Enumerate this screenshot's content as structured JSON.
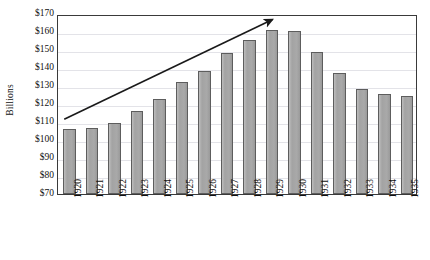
{
  "chart_data": {
    "type": "bar",
    "title": "",
    "subtitle": "",
    "xlabel": "",
    "ylabel": "Billions",
    "categories": [
      "1920",
      "1921",
      "1922",
      "1923",
      "1924",
      "1925",
      "1926",
      "1927",
      "1928",
      "1929",
      "1930",
      "1931",
      "1932",
      "1933",
      "1934",
      "1935"
    ],
    "values": [
      106,
      106.5,
      109.5,
      116,
      123,
      132.5,
      138.5,
      148.5,
      155.5,
      161,
      160.5,
      149,
      137,
      128.5,
      125.5,
      124.5
    ],
    "ylim": [
      70,
      170
    ],
    "ytick_step": 10,
    "ytick_labels": [
      "$170",
      "$160",
      "$150",
      "$140",
      "$130",
      "$120",
      "$110",
      "$100",
      "$90",
      "$80",
      "$70"
    ],
    "ytick_values": [
      170,
      160,
      150,
      140,
      130,
      120,
      110,
      100,
      90,
      80,
      70
    ],
    "grid": "horizontal",
    "legend": "none",
    "bar_color": "#a9a9a9",
    "bar_border_color": "#5d5d5d",
    "grid_color": "#e3e3e8",
    "frame_color": "#3a3a3a",
    "annotations": [
      {
        "name": "upward-trend-arrow",
        "type": "arrow",
        "color": "#1a1a1a",
        "x_start_year": "1920",
        "y_start_value": 112,
        "x_end_year": "1929",
        "y_end_value": 168
      }
    ]
  }
}
